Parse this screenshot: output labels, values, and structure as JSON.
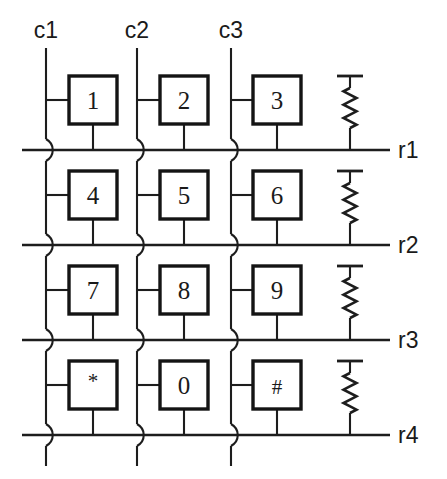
{
  "diagram": {
    "type": "keypad-matrix-schematic",
    "background_color": "#ffffff",
    "line_color": "#1d1d1d",
    "columns": [
      {
        "id": "c1",
        "label": "c1",
        "x": 46,
        "label_x": 46,
        "label_y": 38
      },
      {
        "id": "c2",
        "label": "c2",
        "x": 137,
        "label_x": 137,
        "label_y": 38
      },
      {
        "id": "c3",
        "label": "c3",
        "x": 231,
        "label_x": 231,
        "label_y": 38
      }
    ],
    "column_wire_top": 48,
    "column_wire_bottom": 466,
    "rows": [
      {
        "id": "r1",
        "label": "r1",
        "y": 150,
        "label_x": 398,
        "label_y": 158
      },
      {
        "id": "r2",
        "label": "r2",
        "y": 245,
        "label_x": 398,
        "label_y": 253
      },
      {
        "id": "r3",
        "label": "r3",
        "y": 340,
        "label_x": 340,
        "label_y": 348
      },
      {
        "id": "r4",
        "label": "r4",
        "y": 435,
        "label_x": 398,
        "label_y": 443
      }
    ],
    "row_wire_left": 22,
    "row_wire_right": 390,
    "switch_box": {
      "width": 48,
      "height": 48,
      "stub_left_length": 24
    },
    "keys": [
      {
        "label": "1",
        "row": "r1",
        "col": "c1",
        "box_x": 69,
        "box_y": 76,
        "center_x": 93,
        "center_y": 100
      },
      {
        "label": "2",
        "row": "r1",
        "col": "c2",
        "box_x": 160,
        "box_y": 76,
        "center_x": 184,
        "center_y": 100
      },
      {
        "label": "3",
        "row": "r1",
        "col": "c3",
        "box_x": 253,
        "box_y": 76,
        "center_x": 277,
        "center_y": 100
      },
      {
        "label": "4",
        "row": "r2",
        "col": "c1",
        "box_x": 69,
        "box_y": 171,
        "center_x": 93,
        "center_y": 195
      },
      {
        "label": "5",
        "row": "r2",
        "col": "c2",
        "box_x": 160,
        "box_y": 171,
        "center_x": 184,
        "center_y": 195
      },
      {
        "label": "6",
        "row": "r2",
        "col": "c3",
        "box_x": 253,
        "box_y": 171,
        "center_x": 277,
        "center_y": 195
      },
      {
        "label": "7",
        "row": "r3",
        "col": "c1",
        "box_x": 69,
        "box_y": 266,
        "center_x": 93,
        "center_y": 290
      },
      {
        "label": "8",
        "row": "r3",
        "col": "c2",
        "box_x": 160,
        "box_y": 266,
        "center_x": 184,
        "center_y": 290
      },
      {
        "label": "9",
        "row": "r3",
        "col": "c3",
        "box_x": 253,
        "box_y": 266,
        "center_x": 277,
        "center_y": 290
      },
      {
        "label": "*",
        "row": "r4",
        "col": "c1",
        "box_x": 69,
        "box_y": 361,
        "center_x": 93,
        "center_y": 385
      },
      {
        "label": "0",
        "row": "r4",
        "col": "c2",
        "box_x": 160,
        "box_y": 361,
        "center_x": 184,
        "center_y": 385
      },
      {
        "label": "#",
        "row": "r4",
        "col": "c3",
        "box_x": 253,
        "box_y": 361,
        "center_x": 277,
        "center_y": 385
      }
    ],
    "resistors": [
      {
        "id": "rp1",
        "row": "r1",
        "x": 350,
        "rail_y": 76,
        "zig_top": 88,
        "zig_bottom": 128
      },
      {
        "id": "rp2",
        "row": "r2",
        "x": 350,
        "rail_y": 171,
        "zig_top": 183,
        "zig_bottom": 223
      },
      {
        "id": "rp3",
        "row": "r3",
        "x": 350,
        "rail_y": 266,
        "zig_top": 278,
        "zig_bottom": 318
      },
      {
        "id": "rp4",
        "row": "r4",
        "x": 350,
        "rail_y": 361,
        "zig_top": 373,
        "zig_bottom": 413
      }
    ],
    "resistor_rail_half_width": 13,
    "crossings_note": "S-shaped wire hops where column wires cross row lines indicate no connection"
  }
}
